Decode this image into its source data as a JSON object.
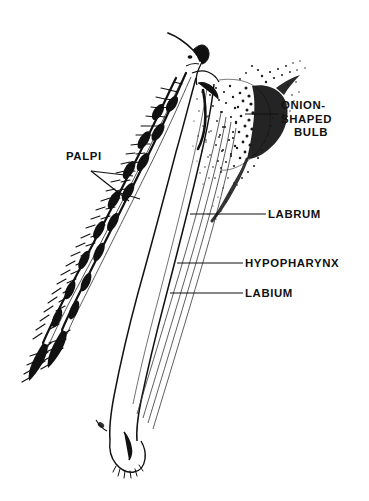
{
  "figure": {
    "style": "stippled pen-and-ink scientific illustration",
    "background_color": "#ffffff",
    "ink_color": "#111111",
    "width": 369,
    "height": 501
  },
  "labels": {
    "palpi": "PALPI",
    "onion_bulb_line1": "ONION-",
    "onion_bulb_line2": "SHAPED",
    "onion_bulb_line3": "BULB",
    "labrum": "LABRUM",
    "hypopharynx": "HYPOPHARYNX",
    "labium": "LABIUM"
  },
  "parts": [
    {
      "name": "palpi",
      "label": "PALPI",
      "description": "paired hairy bristled appendages on the left side",
      "leader": "forked"
    },
    {
      "name": "onion-shaped-bulb",
      "label": "ONION-SHAPED BULB",
      "description": "dark stippled bulbous mass at upper right",
      "leader": "straight"
    },
    {
      "name": "labrum",
      "label": "LABRUM",
      "description": "stylet of the fascicle",
      "leader": "straight"
    },
    {
      "name": "hypopharynx",
      "label": "HYPOPHARYNX",
      "description": "stylet of the fascicle",
      "leader": "straight"
    },
    {
      "name": "labium",
      "label": "LABIUM",
      "description": "sheath enclosing the fascicle",
      "leader": "straight"
    }
  ]
}
